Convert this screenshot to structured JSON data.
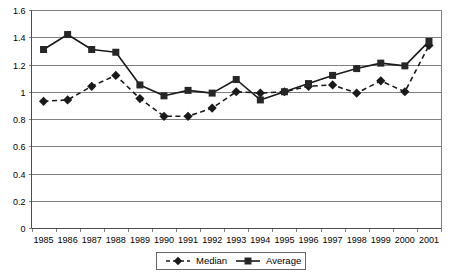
{
  "chart_data": {
    "type": "line",
    "title": "",
    "xlabel": "",
    "ylabel": "",
    "categories": [
      "1985",
      "1986",
      "1987",
      "1988",
      "1989",
      "1990",
      "1991",
      "1992",
      "1993",
      "1994",
      "1995",
      "1996",
      "1997",
      "1998",
      "1999",
      "2000",
      "2001"
    ],
    "series": [
      {
        "name": "Median",
        "marker": "diamond",
        "line_style": "dashed",
        "values": [
          0.93,
          0.94,
          1.04,
          1.12,
          0.95,
          0.82,
          0.82,
          0.88,
          1.0,
          0.99,
          1.0,
          1.04,
          1.05,
          0.99,
          1.08,
          1.0,
          1.34
        ]
      },
      {
        "name": "Average",
        "marker": "square",
        "line_style": "solid",
        "values": [
          1.31,
          1.42,
          1.31,
          1.29,
          1.05,
          0.97,
          1.01,
          0.99,
          1.09,
          0.94,
          1.0,
          1.06,
          1.12,
          1.17,
          1.21,
          1.19,
          1.37
        ]
      }
    ],
    "ylim": [
      0,
      1.6
    ],
    "y_ticks": [
      "0",
      "0.2",
      "0.4",
      "0.6",
      "0.8",
      "1",
      "1.2",
      "1.4",
      "1.6"
    ],
    "y_tick_values": [
      0,
      0.2,
      0.4,
      0.6,
      0.8,
      1.0,
      1.2,
      1.4,
      1.6
    ],
    "grid": true,
    "legend_position": "bottom",
    "legend": [
      "Median",
      "Average"
    ],
    "colors": {
      "series_line": "#1a1a1a",
      "gridline": "#808080",
      "axis": "#4d4d4d",
      "background": "#ffffff"
    }
  }
}
